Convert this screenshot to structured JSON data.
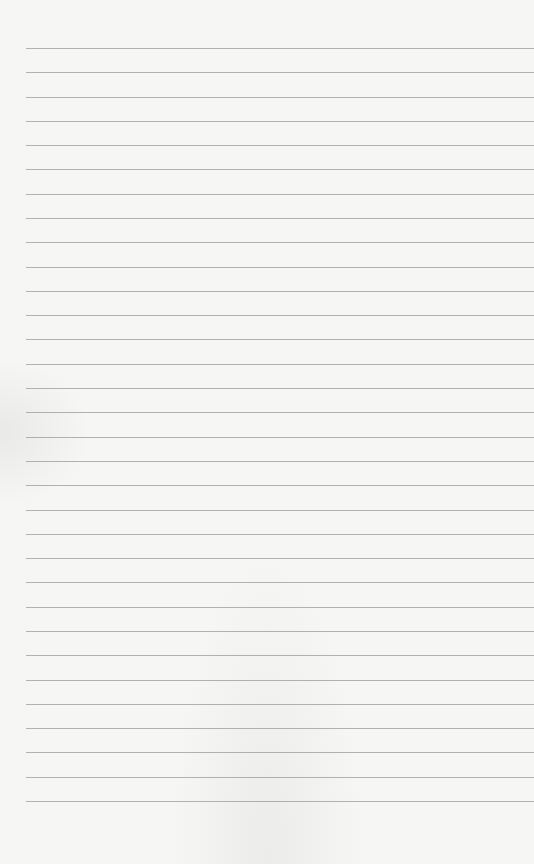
{
  "paper": {
    "kind": "lined-paper",
    "background_color": "#f6f6f5",
    "rule_color": "#9a9a9a",
    "rule_count": 32,
    "first_rule_y": 48,
    "rule_spacing": 24.29,
    "rule_left_x": 26
  }
}
